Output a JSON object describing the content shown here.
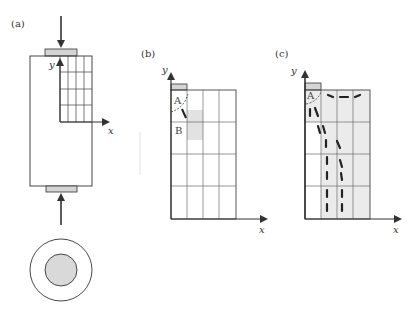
{
  "panels": {
    "a": {
      "label": "(a)",
      "x_axis": "x",
      "y_axis": "y"
    },
    "b": {
      "label": "(b)",
      "x_axis": "x",
      "y_axis": "y",
      "region_a": "A",
      "region_b": "B"
    },
    "c": {
      "label": "(c)",
      "x_axis": "x",
      "y_axis": "y",
      "region_a": "A"
    }
  },
  "colors": {
    "line": "#333333",
    "grid": "#666666",
    "plate_fill": "#d4d4d4",
    "shade": "#e6e6e6",
    "crack": "#222222"
  }
}
